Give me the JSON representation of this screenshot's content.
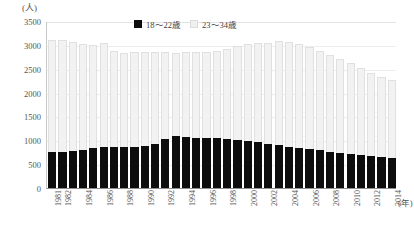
{
  "chart_data": {
    "type": "bar",
    "stacked": true,
    "title": "",
    "xlabel": "(年)",
    "ylabel": "(人)",
    "ylim": [
      0,
      3500
    ],
    "ytick_values": [
      0,
      500,
      1000,
      1500,
      2000,
      2500,
      3000,
      3500
    ],
    "ytick_labels": [
      "0",
      "500",
      "1000",
      "1500",
      "2000",
      "2500",
      "3000",
      "3500"
    ],
    "grid": true,
    "legend_position": "top-center",
    "categories": [
      "1981",
      "1982",
      "1983",
      "1984",
      "1985",
      "1986",
      "1987",
      "1988",
      "1989",
      "1990",
      "1991",
      "1992",
      "1993",
      "1994",
      "1995",
      "1996",
      "1997",
      "1998",
      "1999",
      "2000",
      "2001",
      "2002",
      "2003",
      "2004",
      "2005",
      "2006",
      "2007",
      "2008",
      "2009",
      "2010",
      "2011",
      "2012",
      "2013",
      "2014"
    ],
    "xtick_labels_shown": [
      "1981",
      "1982",
      "1984",
      "1986",
      "1988",
      "1990",
      "1992",
      "1994",
      "1996",
      "1998",
      "2000",
      "2002",
      "2004",
      "2006",
      "2008",
      "2010",
      "2012",
      "2014"
    ],
    "series": [
      {
        "name": "18～22歳",
        "color": "#0d0d0d",
        "values": [
          750,
          760,
          770,
          790,
          830,
          870,
          860,
          850,
          860,
          880,
          930,
          1020,
          1080,
          1070,
          1050,
          1040,
          1040,
          1030,
          1010,
          990,
          960,
          930,
          900,
          870,
          840,
          810,
          790,
          760,
          740,
          720,
          700,
          680,
          650,
          620
        ]
      },
      {
        "name": "23～34歳",
        "color": "#f2f2f2",
        "values": [
          2350,
          2350,
          2280,
          2220,
          2170,
          2160,
          2010,
          1990,
          1990,
          1980,
          1930,
          1830,
          1760,
          1780,
          1800,
          1820,
          1840,
          1890,
          1960,
          2020,
          2080,
          2120,
          2180,
          2190,
          2180,
          2140,
          2090,
          2020,
          1960,
          1900,
          1820,
          1740,
          1680,
          1650
        ]
      }
    ],
    "totals": [
      3100,
      3110,
      3050,
      3010,
      3000,
      3030,
      2870,
      2840,
      2850,
      2860,
      2860,
      2850,
      2840,
      2850,
      2850,
      2860,
      2880,
      2920,
      2970,
      3010,
      3040,
      3050,
      3080,
      3060,
      3020,
      2950,
      2880,
      2780,
      2700,
      2620,
      2520,
      2420,
      2330,
      2270
    ]
  },
  "legend": {
    "items": [
      {
        "label": "18～22歳",
        "swatch": "dark-swatch"
      },
      {
        "label": "23～34歳",
        "swatch": "light-swatch"
      }
    ]
  },
  "axes": {
    "y_unit": "(人)",
    "x_unit": "(年)"
  }
}
